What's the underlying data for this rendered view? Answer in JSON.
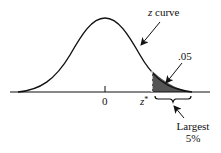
{
  "diagram": {
    "type": "normal-distribution-upper-tail",
    "curve_label_var": "z",
    "curve_label_word": " curve",
    "center_tick_label": "0",
    "critical_value_var": "z",
    "critical_value_sup": "*",
    "tail_area_label": ".05",
    "brace_label_line1": "Largest",
    "brace_label_line2": "5%",
    "colors": {
      "line": "#111111",
      "shade": "#555555",
      "background": "#ffffff"
    }
  }
}
